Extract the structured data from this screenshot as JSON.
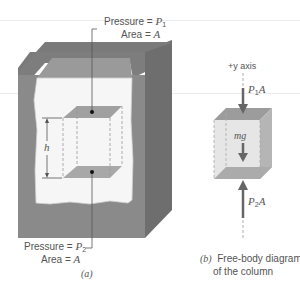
{
  "figure_a": {
    "top_label": {
      "pressure_prefix": "Pressure = ",
      "pressure_var": "P",
      "pressure_sub": "1",
      "area_prefix": "Area = ",
      "area_var": "A"
    },
    "bottom_label": {
      "pressure_prefix": "Pressure = ",
      "pressure_var": "P",
      "pressure_sub": "2",
      "area_prefix": "Area = ",
      "area_var": "A"
    },
    "height_label": "h",
    "caption": "(a)"
  },
  "figure_b": {
    "axis_label": "+y axis",
    "top_force": {
      "var": "P",
      "sub": "1",
      "suffix": "A"
    },
    "weight_label": "mg",
    "bottom_force": {
      "var": "P",
      "sub": "2",
      "suffix": "A"
    },
    "caption_letter": "(b)",
    "caption_line1": "Free-body diagram",
    "caption_line2": "of the column"
  },
  "colors": {
    "container_front": "#8a8a8a",
    "container_side": "#6e6e6e",
    "container_rim": "#7d7d7d",
    "fluid": "#f6f6f6",
    "column_face": "#9a9a9a",
    "column_fill": "#e8e8e8",
    "arrow": "#666666"
  }
}
